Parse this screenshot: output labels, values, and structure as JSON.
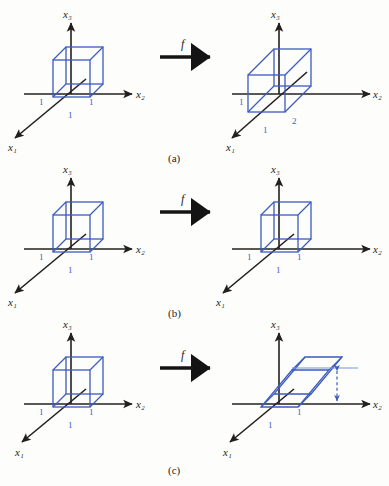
{
  "figure": {
    "type": "math-diagram",
    "background_color": "#fdfdfc",
    "axis_color": "#231f20",
    "shape_color": "#3b5bc0",
    "label_color": "#1d1d1d",
    "map_label": "f"
  },
  "panels": [
    {
      "id": "a",
      "caption": "(a)",
      "map_label": "f",
      "source": {
        "name": "unit-cube",
        "axes": {
          "x1": "x₁",
          "x2": "x₂",
          "x3": "x₃"
        },
        "tick_labels": {
          "x2": "1",
          "x1": "1",
          "x3": "1"
        }
      },
      "target": {
        "name": "stretched-box",
        "axes": {
          "x1": "x₁",
          "x2": "x₂",
          "x3": "x₃"
        },
        "tick_labels": {
          "x2": "1",
          "x1": "1",
          "depth": "2"
        }
      }
    },
    {
      "id": "b",
      "caption": "(b)",
      "map_label": "f",
      "source": {
        "name": "unit-cube",
        "axes": {
          "x1": "x₁",
          "x2": "x₂",
          "x3": "x₃"
        },
        "tick_labels": {
          "x2": "1",
          "x1": "1",
          "x3": "1"
        }
      },
      "target": {
        "name": "unit-cube",
        "axes": {
          "x1": "x₁",
          "x2": "x₂",
          "x3": "x₃"
        },
        "tick_labels": {
          "x2": "1",
          "x1": "1",
          "x3": "1"
        }
      }
    },
    {
      "id": "c",
      "caption": "(c)",
      "map_label": "f",
      "source": {
        "name": "unit-cube",
        "axes": {
          "x1": "x₁",
          "x2": "x₂",
          "x3": "x₃"
        },
        "tick_labels": {
          "x2": "1",
          "x1": "1",
          "x3": "1"
        }
      },
      "target": {
        "name": "sheared-box",
        "axes": {
          "x1": "x₁",
          "x2": "x₂",
          "x3": "x₃"
        },
        "tick_labels": {
          "x2": "1",
          "x1": "1",
          "height": "1"
        },
        "height_marker": "dashed double arrow"
      }
    }
  ],
  "axis_labels": {
    "x1": "x₁",
    "x2": "x₂",
    "x3": "x₃"
  },
  "values": {
    "one": "1",
    "two": "2"
  },
  "captions": {
    "a": "(a)",
    "b": "(b)",
    "c": "(c)"
  }
}
